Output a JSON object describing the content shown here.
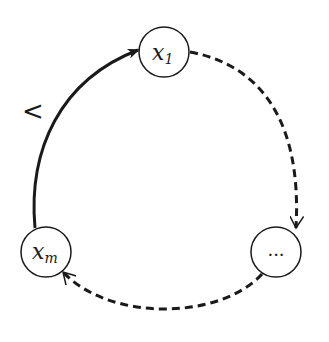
{
  "diagram": {
    "type": "cycle",
    "nodes": [
      {
        "id": "x1",
        "label": "x",
        "subscript": "1",
        "cx": 164,
        "cy": 52
      },
      {
        "id": "dots",
        "label": "...",
        "subscript": "",
        "cx": 276,
        "cy": 252
      },
      {
        "id": "xm",
        "label": "x",
        "subscript": "m",
        "cx": 46,
        "cy": 252
      }
    ],
    "edges": [
      {
        "from": "x1",
        "to": "dots",
        "style": "dashed"
      },
      {
        "from": "dots",
        "to": "xm",
        "style": "dashed"
      },
      {
        "from": "xm",
        "to": "x1",
        "style": "solid",
        "label": "<"
      }
    ],
    "colors": {
      "stroke": "#1a1a1a",
      "background": "#ffffff"
    }
  }
}
